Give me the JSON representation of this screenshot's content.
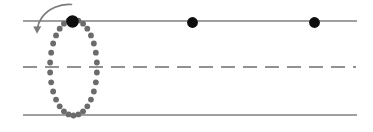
{
  "figure": {
    "title": "Dotted loop trajectory crossing three horizontal reference lines",
    "width": 373,
    "height": 132,
    "background_color": "#ffffff"
  },
  "colors": {
    "line_gray": "#7f7f7f",
    "dash_gray": "#6e6e6e",
    "dot_gray": "#6b6b6b",
    "marker_black": "#0d0d0d",
    "arrow_gray": "#7a7a7a"
  },
  "reference_lines": [
    {
      "name": "top-solid-line",
      "style": "solid",
      "y": 21,
      "x_start": 23,
      "x_end": 357,
      "color": "#7f7f7f",
      "stroke_width": 1.6
    },
    {
      "name": "middle-dashed-line",
      "style": "dashed",
      "y": 67,
      "x_start": 23,
      "x_end": 356,
      "color": "#6e6e6e",
      "stroke_width": 1.5,
      "dash_length": 14,
      "dash_gap": 8
    },
    {
      "name": "bottom-solid-line",
      "style": "solid",
      "y": 115,
      "x_start": 23,
      "x_end": 357,
      "color": "#7f7f7f",
      "stroke_width": 1.6
    }
  ],
  "dotted_loop": {
    "name": "dotted-ellipse-orbit",
    "center_x": 73.5,
    "center_y": 67.5,
    "radius_x": 23.5,
    "radius_y": 48,
    "dot_count": 30,
    "dot_radius": 2.9,
    "dot_color": "#6b6b6b",
    "start_angle_deg": -90,
    "description": "Closed dotted elliptical path spanning from the top solid line down to the bottom solid line"
  },
  "markers": [
    {
      "name": "marker-on-loop-top",
      "cx": 72.5,
      "cy": 21.5,
      "r": 6.2,
      "color": "#0d0d0d",
      "on_line": "top-solid-line"
    },
    {
      "name": "marker-middle",
      "cx": 192.5,
      "cy": 22.5,
      "r": 5.4,
      "color": "#0d0d0d",
      "on_line": "top-solid-line"
    },
    {
      "name": "marker-right",
      "cx": 314.5,
      "cy": 22.5,
      "r": 5.4,
      "color": "#0d0d0d",
      "on_line": "top-solid-line"
    }
  ],
  "direction_arrow": {
    "name": "counterclockwise-direction-arrow",
    "color": "#7a7a7a",
    "stroke_width": 1.7,
    "path": "M 71.5 4.5 C 61 3.5 48 8.5 41.5 18 C 38.8 22 37.6 26 37.2 29.5",
    "head_points": "37.0,33.8 33.3,26.6 41.3,26.3",
    "description": "Curved arrow above and left of the loop, pointing down-left to indicate counterclockwise travel"
  }
}
